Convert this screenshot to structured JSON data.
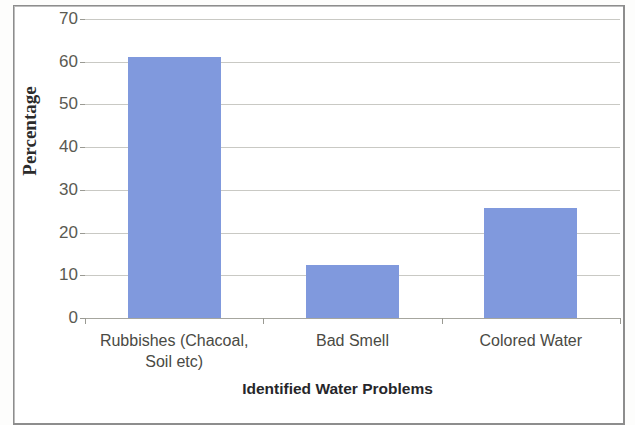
{
  "chart_data": {
    "type": "bar",
    "title": "",
    "xlabel": "Identified Water Problems",
    "ylabel": "Percentage",
    "categories": [
      "Rubbishes (Chacoal, Soil etc)",
      "Bad Smell",
      "Colored Water"
    ],
    "category_lines": [
      [
        "Rubbishes (Chacoal,",
        "Soil etc)"
      ],
      [
        "Bad Smell"
      ],
      [
        "Colored Water"
      ]
    ],
    "values": [
      61.2,
      12.3,
      25.8
    ],
    "ylim": [
      0,
      70
    ],
    "yticks": [
      0,
      10,
      20,
      30,
      40,
      50,
      60,
      70
    ],
    "ytick_labels": [
      "0",
      "10",
      "20",
      "30",
      "40",
      "50",
      "60",
      "70"
    ],
    "grid": true,
    "legend": "none",
    "bar_color": "#8099DD",
    "gridline_color": "#C9C9C4",
    "axis_color": "#A6A69E",
    "tick_label_color": "#5A5A52",
    "axis_title_color": "#26262A"
  }
}
